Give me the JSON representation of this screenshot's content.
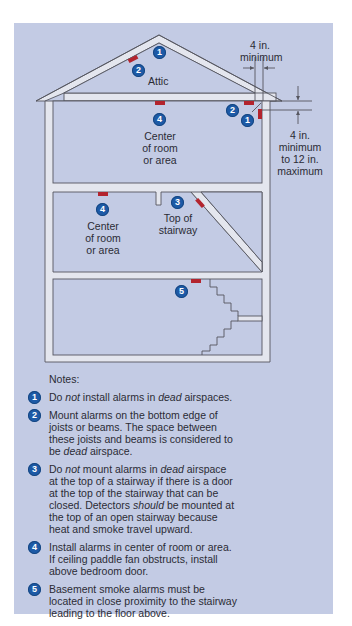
{
  "colors": {
    "panel_bg": "#c3cbe4",
    "wall_fill": "#e4e6ee",
    "wall_line": "#55565f",
    "alarm": "#b3242e",
    "badge": "#1d5aa6"
  },
  "diagram": {
    "attic_label": "Attic",
    "dimension_top": {
      "line1": "4 in.",
      "line2": "minimum"
    },
    "dimension_right": {
      "line1": "4 in.",
      "line2": "minimum",
      "line3": "to 12 in.",
      "line4": "maximum"
    },
    "first_floor_label": {
      "line1": "Center",
      "line2": "of room",
      "line3": "or area"
    },
    "second_floor_label": {
      "line1": "Center",
      "line2": "of room",
      "line3": "or area"
    },
    "stairway_label": {
      "line1": "Top of",
      "line2": "stairway"
    },
    "badges": {
      "attic_peak": "1",
      "attic_slope": "2",
      "upper_center": "4",
      "corner_joist": "2",
      "corner_dead": "1",
      "lower_center": "4",
      "stair_top": "3",
      "basement": "5"
    }
  },
  "notes": {
    "title": "Notes:",
    "items": [
      {
        "number": "1",
        "parts": [
          "Do ",
          "not",
          " install alarms in ",
          "dead",
          " airspaces."
        ]
      },
      {
        "number": "2",
        "parts": [
          "Mount alarms on the bottom edge of joists or beams. The space between these joists and beams is considered to be ",
          "dead",
          " airspace."
        ]
      },
      {
        "number": "3",
        "parts": [
          "Do ",
          "not",
          " mount alarms in ",
          "dead",
          " airspace at the top of a stairway if there is a door at the top of the stairway that can be closed. Detectors ",
          "should",
          " be mounted at the top of an open stairway because heat and smoke travel upward."
        ]
      },
      {
        "number": "4",
        "parts": [
          "Install alarms in center of room or area. If ceiling paddle fan obstructs, install above bedroom door."
        ]
      },
      {
        "number": "5",
        "parts": [
          "Basement smoke alarms must be located in close proximity to the stairway leading to the floor above."
        ]
      }
    ]
  }
}
